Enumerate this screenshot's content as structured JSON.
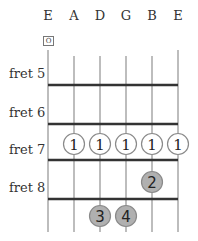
{
  "diagram": {
    "strings": [
      {
        "label": "E",
        "x": 48
      },
      {
        "label": "A",
        "x": 74
      },
      {
        "label": "D",
        "x": 100
      },
      {
        "label": "G",
        "x": 126
      },
      {
        "label": "B",
        "x": 152
      },
      {
        "label": "E",
        "x": 178
      }
    ],
    "open_marker": {
      "string_index": 0,
      "symbol": "O"
    },
    "frets": [
      {
        "label": "fret 5",
        "label_y": 66
      },
      {
        "label": "fret 6",
        "label_y": 105
      },
      {
        "label": "fret 7",
        "label_y": 142
      },
      {
        "label": "fret 8",
        "label_y": 180
      }
    ],
    "fret_lines_y": [
      85,
      124,
      160,
      199
    ],
    "fingers": [
      {
        "string_index": 1,
        "fret": 7,
        "finger": "1",
        "style": "outline"
      },
      {
        "string_index": 2,
        "fret": 7,
        "finger": "1",
        "style": "outline"
      },
      {
        "string_index": 3,
        "fret": 7,
        "finger": "1",
        "style": "outline"
      },
      {
        "string_index": 4,
        "fret": 7,
        "finger": "1",
        "style": "outline"
      },
      {
        "string_index": 5,
        "fret": 7,
        "finger": "1",
        "style": "outline"
      },
      {
        "string_index": 4,
        "fret": 8,
        "finger": "2",
        "style": "filled"
      },
      {
        "string_index": 2,
        "fret": 9,
        "finger": "3",
        "style": "filled"
      },
      {
        "string_index": 3,
        "fret": 9,
        "finger": "4",
        "style": "filled"
      }
    ],
    "colors": {
      "string": "#9a9a9a",
      "fret_line": "#333333",
      "outline_fill": "#ffffff",
      "filled_fill": "#b0b0b0",
      "dot_stroke": "#8a8a8a",
      "text": "#333333"
    }
  }
}
